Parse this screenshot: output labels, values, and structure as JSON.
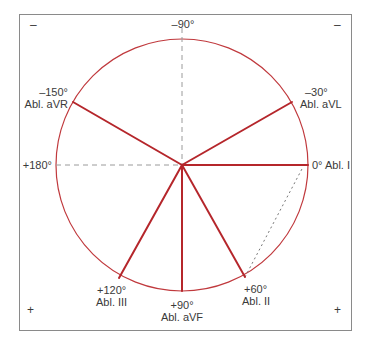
{
  "diagram": {
    "colors": {
      "lead_line": "#b5262b",
      "circle": "#c0393d",
      "axis_dash": "#9a9a9a",
      "frame": "#8a8a8a",
      "text": "#3a3a3a"
    },
    "corners": {
      "top_left": "–",
      "top_right": "–",
      "bottom_left": "+",
      "bottom_right": "+"
    },
    "axes": {
      "top": "–90°",
      "left": "+180°"
    },
    "leads": [
      {
        "angle": "0°",
        "name": "Abl. I",
        "label": "0° Abl. I"
      },
      {
        "angle": "–30°",
        "name": "Abl. aVL"
      },
      {
        "angle": "–150°",
        "name": "Abl. aVR"
      },
      {
        "angle": "+60°",
        "name": "Abl. II"
      },
      {
        "angle": "+90°",
        "name": "Abl. aVF"
      },
      {
        "angle": "+120°",
        "name": "Abl. III"
      }
    ]
  }
}
